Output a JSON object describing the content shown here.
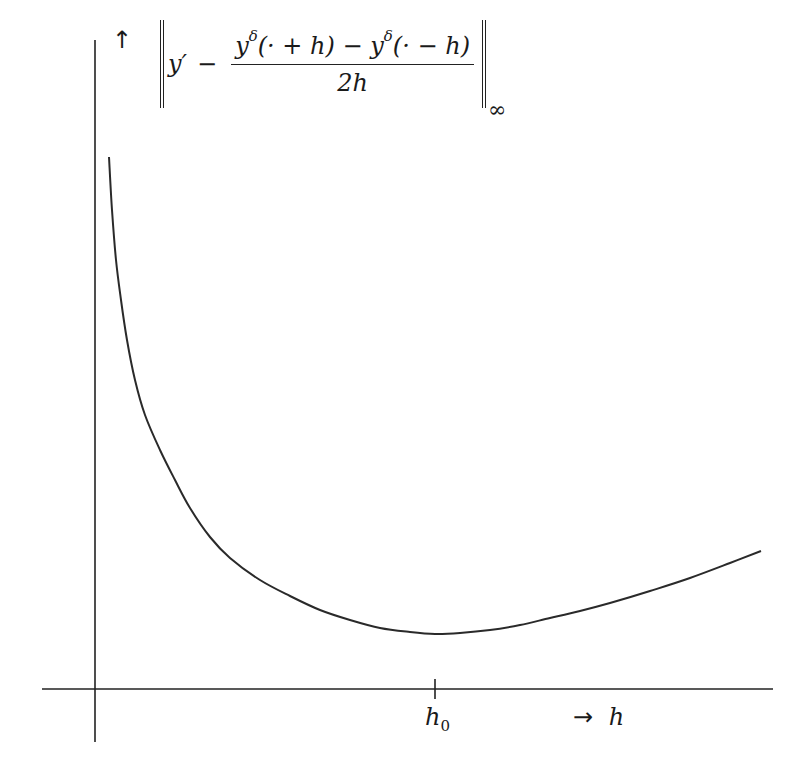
{
  "chart_data": {
    "type": "line",
    "title": "",
    "ylabel": "‖y′ − (y^δ(·+h) − y^δ(·−h)) / (2h)‖_∞",
    "xlabel": "h",
    "grid": false,
    "legend": null,
    "x_ticks": [
      {
        "label": "h0",
        "pixel_x": 435
      }
    ],
    "axis_ranges": {
      "x": "qualitative (no numeric ticks)",
      "y": "qualitative (no numeric ticks)"
    },
    "note": "Qualitative error curve: decreases steeply for small h, reaches a minimum at h0, then increases roughly linearly. Values in pixel coordinates.",
    "series": [
      {
        "name": "total error",
        "points_px": [
          [
            109,
            157
          ],
          [
            112,
            210
          ],
          [
            116,
            260
          ],
          [
            121,
            300
          ],
          [
            127,
            340
          ],
          [
            135,
            380
          ],
          [
            145,
            415
          ],
          [
            160,
            450
          ],
          [
            175,
            480
          ],
          [
            190,
            508
          ],
          [
            210,
            537
          ],
          [
            230,
            558
          ],
          [
            260,
            580
          ],
          [
            290,
            596
          ],
          [
            320,
            610
          ],
          [
            350,
            620
          ],
          [
            380,
            628
          ],
          [
            410,
            632
          ],
          [
            435,
            634
          ],
          [
            460,
            633
          ],
          [
            490,
            630
          ],
          [
            520,
            625
          ],
          [
            550,
            618
          ],
          [
            580,
            611
          ],
          [
            610,
            603
          ],
          [
            650,
            591
          ],
          [
            690,
            578
          ],
          [
            730,
            563
          ],
          [
            761,
            551
          ]
        ]
      }
    ]
  },
  "axes": {
    "origin_px": [
      95,
      689
    ],
    "y_axis": {
      "x": 95,
      "top": 40,
      "bottom": 742
    },
    "x_axis": {
      "y": 689,
      "left": 42,
      "right": 773
    }
  },
  "labels": {
    "y_arrow": "↑",
    "norm_y_prime": "y′",
    "norm_minus": "−",
    "numerator_part1": "y",
    "numerator_sup1": "δ",
    "numerator_part2": "(· + h) − ",
    "numerator_part3": "y",
    "numerator_sup2": "δ",
    "numerator_part4": "(· − h)",
    "denominator": "2h",
    "norm_subscript": "∞",
    "h0_base": "h",
    "h0_sub": "0",
    "x_arrow": "→",
    "x_var": "h"
  },
  "colors": {
    "ink": "#222222",
    "background": "#ffffff"
  }
}
